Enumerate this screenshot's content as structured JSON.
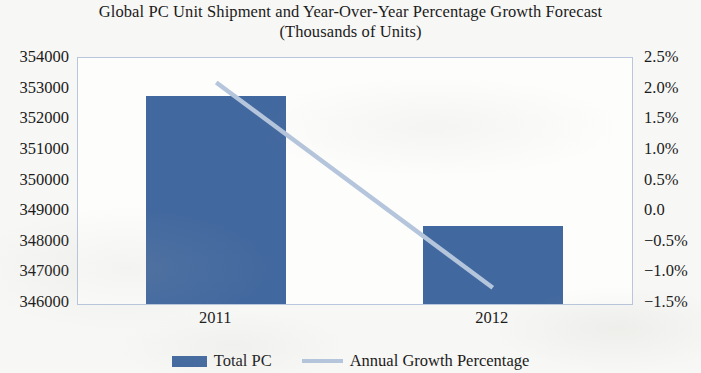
{
  "chart_data": {
    "type": "bar",
    "title": "Global PC Unit Shipment and Year-Over-Year Percentage Growth Forecast",
    "subtitle": "(Thousands of Units)",
    "title_line1": "Global PC Unit Shipment and Year-Over-Year Percentage Growth Forecast",
    "title_line2": "(Thousands of Units)",
    "xlabel": "",
    "ylabel": "",
    "categories": [
      "2011",
      "2012"
    ],
    "grid": false,
    "legend_position": "bottom",
    "series": [
      {
        "name": "Total PC",
        "type": "bar",
        "axis": "left",
        "color": "#41689f",
        "values": [
          352800,
          348550
        ]
      },
      {
        "name": "Annual Growth Percentage",
        "type": "line",
        "axis": "right",
        "color": "#b4c5dc",
        "values": [
          2.1,
          -1.25
        ],
        "value_labels": [
          "2.1%",
          "-1.25%"
        ]
      }
    ],
    "left_axis": {
      "min": 346000,
      "max": 354000,
      "step": 1000,
      "ticks": [
        354000,
        353000,
        352000,
        351000,
        350000,
        349000,
        348000,
        347000,
        346000
      ],
      "tick_labels": [
        "354000",
        "353000",
        "352000",
        "351000",
        "350000",
        "349000",
        "348000",
        "347000",
        "346000"
      ]
    },
    "right_axis": {
      "min": -1.5,
      "max": 2.5,
      "step": 0.5,
      "ticks": [
        2.5,
        2.0,
        1.5,
        1.0,
        0.5,
        0.0,
        -0.5,
        -1.0,
        -1.5
      ],
      "tick_labels": [
        "2.5%",
        "2.0%",
        "1.5%",
        "1.0%",
        "0.5%",
        "0.0",
        "−0.5%",
        "−1.0%",
        "−1.5%"
      ]
    },
    "legend": [
      {
        "label": "Total PC",
        "marker": "bar-swatch",
        "color": "#41689f"
      },
      {
        "label": "Annual Growth Percentage",
        "marker": "line-swatch",
        "color": "#b4c5dc"
      }
    ]
  }
}
